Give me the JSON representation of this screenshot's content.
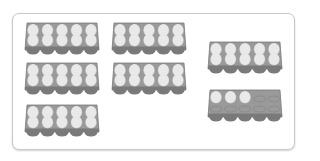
{
  "scene": {
    "description": "Egg cartons grouped in a rounded frame",
    "slots_per_carton": 10,
    "rows_per_carton": 2,
    "columns_per_carton": 5,
    "colors": {
      "carton_fill": "#9a9a9a",
      "carton_dark": "#7a7a7a",
      "egg_fill": "#e9e9e9",
      "egg_shadow": "#c4c4c4",
      "empty_slot": "#8c8c8c",
      "frame_border": "#c8c8c8"
    },
    "cartons": [
      {
        "id": "carton-1",
        "eggs": 10
      },
      {
        "id": "carton-2",
        "eggs": 10
      },
      {
        "id": "carton-3",
        "eggs": 10
      },
      {
        "id": "carton-4",
        "eggs": 10
      },
      {
        "id": "carton-5",
        "eggs": 10
      },
      {
        "id": "carton-6",
        "eggs": 10
      },
      {
        "id": "carton-7",
        "eggs": 3
      }
    ],
    "total_eggs": 63
  }
}
